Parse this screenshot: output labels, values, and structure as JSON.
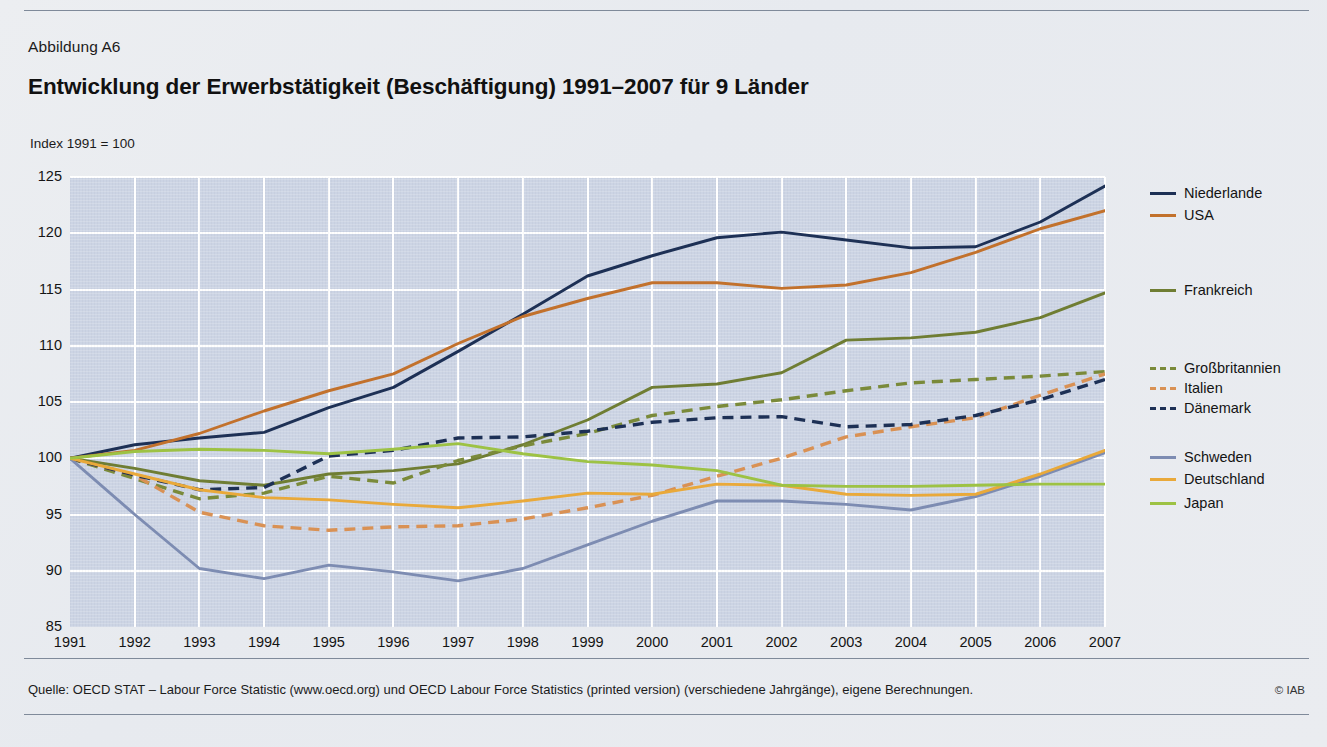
{
  "figure": {
    "number": "Abbildung A6",
    "title": "Entwicklung der Erwerbstätigkeit (Beschäftigung) 1991–2007 für 9 Länder",
    "axis_note": "Index 1991 = 100",
    "source": "Quelle: OECD STAT – Labour Force Statistic (www.oecd.org) und OECD Labour Force Statistics (printed version) (verschiedene Jahrgänge), eigene Berechnungen.",
    "copyright": "© IAB"
  },
  "chart_data": {
    "type": "line",
    "title": "Entwicklung der Erwerbstätigkeit (Beschäftigung) 1991–2007 für 9 Länder",
    "subtitle": "Index 1991 = 100",
    "xlabel": "",
    "ylabel": "Index 1991 = 100",
    "xlim": [
      1991,
      2007
    ],
    "ylim": [
      85,
      125
    ],
    "yticks": [
      85,
      90,
      95,
      100,
      105,
      110,
      115,
      120,
      125
    ],
    "grid": true,
    "legend_position": "right",
    "x": [
      1991,
      1992,
      1993,
      1994,
      1995,
      1996,
      1997,
      1998,
      1999,
      2000,
      2001,
      2002,
      2003,
      2004,
      2005,
      2006,
      2007
    ],
    "series": [
      {
        "name": "Niederlande",
        "color": "#1d3055",
        "style": "solid",
        "values": [
          100.0,
          101.2,
          101.8,
          102.3,
          104.5,
          106.3,
          109.5,
          112.8,
          116.2,
          118.0,
          119.6,
          120.1,
          119.4,
          118.7,
          118.8,
          121.0,
          124.2
        ]
      },
      {
        "name": "USA",
        "color": "#c2712c",
        "style": "solid",
        "values": [
          100.0,
          100.7,
          102.2,
          104.2,
          106.0,
          107.5,
          110.2,
          112.6,
          114.2,
          115.6,
          115.6,
          115.1,
          115.4,
          116.5,
          118.3,
          120.4,
          122.0
        ]
      },
      {
        "name": "Frankreich",
        "color": "#6f7d33",
        "style": "solid",
        "values": [
          100.0,
          99.1,
          98.0,
          97.6,
          98.6,
          98.9,
          99.5,
          101.2,
          103.4,
          106.3,
          106.6,
          107.6,
          110.5,
          110.7,
          111.2,
          112.5,
          114.7
        ]
      },
      {
        "name": "Großbritannien",
        "color": "#7a8a3a",
        "style": "dashed",
        "values": [
          100.0,
          98.2,
          96.4,
          96.9,
          98.4,
          97.8,
          99.8,
          101.1,
          102.2,
          103.8,
          104.6,
          105.2,
          106.0,
          106.7,
          107.0,
          107.3,
          107.7
        ]
      },
      {
        "name": "Italien",
        "color": "#d99154",
        "style": "dashed",
        "values": [
          100.0,
          98.5,
          95.2,
          94.0,
          93.6,
          93.9,
          94.0,
          94.6,
          95.6,
          96.7,
          98.4,
          100.0,
          101.9,
          102.8,
          103.6,
          105.6,
          107.5
        ]
      },
      {
        "name": "Dänemark",
        "color": "#1d3055",
        "style": "dashed",
        "values": [
          100.0,
          98.5,
          97.2,
          97.4,
          100.2,
          100.7,
          101.8,
          101.9,
          102.4,
          103.2,
          103.6,
          103.7,
          102.8,
          103.0,
          103.8,
          105.2,
          107.0
        ]
      },
      {
        "name": "Schweden",
        "color": "#7d8cb2",
        "style": "solid",
        "values": [
          100.0,
          95.0,
          90.2,
          89.3,
          90.5,
          89.9,
          89.1,
          90.2,
          92.3,
          94.4,
          96.2,
          96.2,
          95.9,
          95.4,
          96.6,
          98.4,
          100.5
        ]
      },
      {
        "name": "Deutschland",
        "color": "#e9a93a",
        "style": "solid",
        "values": [
          100.0,
          98.6,
          97.2,
          96.5,
          96.3,
          95.9,
          95.6,
          96.2,
          96.9,
          96.8,
          97.7,
          97.6,
          96.8,
          96.7,
          96.8,
          98.6,
          100.7
        ]
      },
      {
        "name": "Japan",
        "color": "#9dc244",
        "style": "solid",
        "values": [
          100.0,
          100.6,
          100.8,
          100.7,
          100.4,
          100.8,
          101.3,
          100.4,
          99.7,
          99.4,
          98.9,
          97.6,
          97.5,
          97.5,
          97.6,
          97.7,
          97.7
        ]
      }
    ]
  },
  "legend": {
    "items": [
      {
        "label": "Niederlande",
        "color": "#1d3055",
        "style": "solid",
        "top": 13
      },
      {
        "label": "USA",
        "color": "#c2712c",
        "style": "solid",
        "top": 35
      },
      {
        "label": "Frankreich",
        "color": "#6f7d33",
        "style": "solid",
        "top": 110
      },
      {
        "label": "Großbritannien",
        "color": "#7a8a3a",
        "style": "dashed",
        "top": 188
      },
      {
        "label": "Italien",
        "color": "#d99154",
        "style": "dashed",
        "top": 208
      },
      {
        "label": "Dänemark",
        "color": "#1d3055",
        "style": "dashed",
        "top": 228
      },
      {
        "label": "Schweden",
        "color": "#7d8cb2",
        "style": "solid",
        "top": 277
      },
      {
        "label": "Deutschland",
        "color": "#e9a93a",
        "style": "solid",
        "top": 299
      },
      {
        "label": "Japan",
        "color": "#9dc244",
        "style": "solid",
        "top": 323
      }
    ]
  }
}
